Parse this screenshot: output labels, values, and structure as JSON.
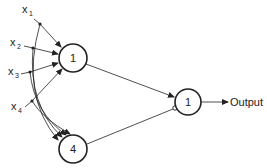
{
  "diagram": {
    "type": "neural-network",
    "inputs": [
      {
        "name": "x",
        "sub": "1"
      },
      {
        "name": "x",
        "sub": "2"
      },
      {
        "name": "x",
        "sub": "3"
      },
      {
        "name": "x",
        "sub": "4"
      }
    ],
    "hidden_nodes": [
      {
        "label": "1"
      },
      {
        "label": "4"
      }
    ],
    "output_node": {
      "label": "1"
    },
    "output_label": "Output",
    "connections": [
      {
        "from": "hidden-1",
        "to": "output-1",
        "type": "excitatory"
      },
      {
        "from": "hidden-4",
        "to": "output-1",
        "type": "inhibitory"
      }
    ],
    "colors": {
      "stroke": "#222222",
      "background": "#ffffff"
    }
  }
}
